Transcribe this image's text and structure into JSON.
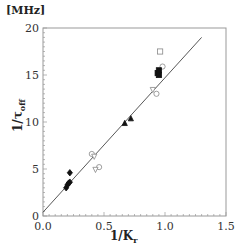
{
  "chart_data": {
    "type": "scatter",
    "title": "",
    "unit_label": "[MHz]",
    "xlabel": "1/K_r",
    "ylabel": "1/τ_off",
    "xlim": [
      0.0,
      1.5
    ],
    "ylim": [
      0,
      20
    ],
    "x_ticks": [
      "0.0",
      "0.5",
      "1.0",
      "1.5"
    ],
    "y_ticks": [
      "0",
      "5",
      "10",
      "15",
      "20"
    ],
    "grid": false,
    "legend": null,
    "fit_line": {
      "x": [
        0.0,
        1.3
      ],
      "y": [
        0.4,
        19.0
      ]
    },
    "series": [
      {
        "name": "filled-diamond",
        "marker": "diamond",
        "filled": true,
        "points": [
          [
            0.19,
            3.0
          ],
          [
            0.2,
            3.3
          ],
          [
            0.21,
            3.5
          ],
          [
            0.22,
            3.6
          ],
          [
            0.22,
            4.6
          ]
        ]
      },
      {
        "name": "open-circle",
        "marker": "circle",
        "filled": false,
        "points": [
          [
            0.4,
            6.6
          ],
          [
            0.46,
            5.2
          ],
          [
            0.93,
            13.0
          ],
          [
            0.98,
            15.9
          ]
        ]
      },
      {
        "name": "open-triangle",
        "marker": "triangle-down",
        "filled": false,
        "points": [
          [
            0.42,
            6.3
          ],
          [
            0.43,
            4.9
          ],
          [
            0.9,
            13.4
          ]
        ]
      },
      {
        "name": "filled-triangle",
        "marker": "triangle",
        "filled": true,
        "points": [
          [
            0.67,
            9.9
          ],
          [
            0.72,
            10.4
          ]
        ]
      },
      {
        "name": "filled-square",
        "marker": "square",
        "filled": true,
        "points": [
          [
            0.94,
            15.2
          ],
          [
            0.95,
            15.5
          ],
          [
            0.95,
            15.0
          ]
        ]
      },
      {
        "name": "open-square",
        "marker": "square",
        "filled": false,
        "points": [
          [
            0.96,
            17.5
          ]
        ]
      }
    ]
  }
}
